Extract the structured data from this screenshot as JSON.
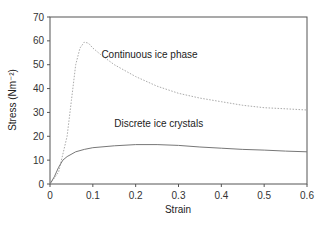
{
  "chart_data": {
    "type": "line",
    "title": "",
    "xlabel": "Strain",
    "ylabel": "Stress (Nm⁻²)",
    "xlim": [
      0,
      0.6
    ],
    "ylim": [
      0,
      70
    ],
    "xticks": [
      0,
      0.1,
      0.2,
      0.3,
      0.4,
      0.5,
      0.6
    ],
    "yticks": [
      0,
      10,
      20,
      30,
      40,
      50,
      60,
      70
    ],
    "grid": false,
    "legend": "inline annotations",
    "series": [
      {
        "name": "Continuous ice phase",
        "style": "dotted",
        "color": "#aaaaaa",
        "x": [
          0,
          0.02,
          0.04,
          0.05,
          0.06,
          0.07,
          0.08,
          0.09,
          0.1,
          0.12,
          0.15,
          0.2,
          0.25,
          0.3,
          0.35,
          0.4,
          0.45,
          0.5,
          0.55,
          0.6
        ],
        "values": [
          0,
          5,
          20,
          35,
          50,
          57,
          59.5,
          59,
          57,
          54,
          50,
          45,
          41,
          38,
          36,
          34.5,
          33,
          32,
          31.5,
          31
        ]
      },
      {
        "name": "Discrete ice crystals",
        "style": "solid",
        "color": "#777777",
        "x": [
          0,
          0.01,
          0.02,
          0.03,
          0.04,
          0.06,
          0.08,
          0.1,
          0.15,
          0.2,
          0.25,
          0.3,
          0.35,
          0.4,
          0.45,
          0.5,
          0.55,
          0.6
        ],
        "values": [
          0,
          3,
          7,
          10,
          11.5,
          13.5,
          14.5,
          15.2,
          16,
          16.5,
          16.5,
          16.2,
          15.5,
          15,
          14.5,
          14.2,
          13.8,
          13.5
        ]
      }
    ],
    "annotations": [
      {
        "text": "Continuous ice phase",
        "x": 0.12,
        "y": 53
      },
      {
        "text": "Discrete ice crystals",
        "x": 0.15,
        "y": 24
      }
    ]
  }
}
